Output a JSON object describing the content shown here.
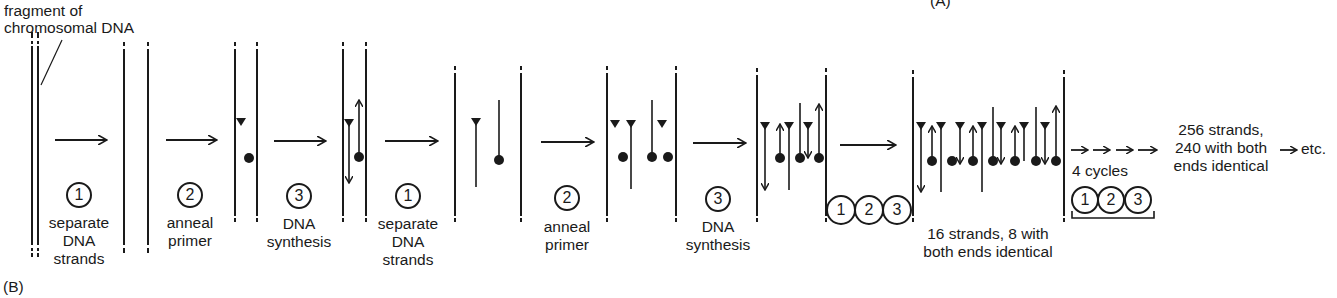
{
  "panel_labels": {
    "top": "(A)",
    "bottom": "(B)"
  },
  "callout": {
    "line1": "fragment of",
    "line2": "chromosomal DNA"
  },
  "steps": [
    {
      "number": "1",
      "line1": "separate",
      "line2": "DNA",
      "line3": "strands"
    },
    {
      "number": "2",
      "line1": "anneal",
      "line2": "primer"
    },
    {
      "number": "3",
      "line1": "DNA",
      "line2": "synthesis"
    },
    {
      "number": "1",
      "line1": "separate",
      "line2": "DNA",
      "line3": "strands"
    },
    {
      "number": "2",
      "line1": "anneal",
      "line2": "primer"
    },
    {
      "number": "3",
      "line1": "DNA",
      "line2": "synthesis"
    }
  ],
  "cycle_group_1": {
    "numbers": [
      "1",
      "2",
      "3"
    ],
    "caption_line1": "16 strands, 8 with",
    "caption_line2": "both ends identical"
  },
  "cycle_group_2": {
    "label": "4 cycles",
    "numbers": [
      "1",
      "2",
      "3"
    ]
  },
  "result": {
    "line1": "256 strands,",
    "line2": "240 with both",
    "line3": "ends identical",
    "etc": "etc."
  },
  "colors": {
    "ink": "#1a1a1a",
    "background": "#ffffff"
  }
}
